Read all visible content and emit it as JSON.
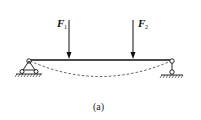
{
  "diagram": {
    "type": "simply-supported-beam",
    "loads": [
      {
        "symbol": "F",
        "subscript": "1",
        "x": 69
      },
      {
        "symbol": "F",
        "subscript": "2",
        "x": 133
      }
    ],
    "supports": {
      "left": "pin-support",
      "right": "roller-support"
    },
    "deflection_curve": "dashed",
    "caption": "(a)"
  }
}
